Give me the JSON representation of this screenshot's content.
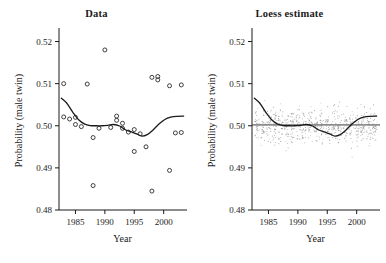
{
  "figure": {
    "width": 386,
    "height": 263,
    "background": "#ffffff",
    "ink_color": "#1a1a1a",
    "cloud_color": "#8a8a8a"
  },
  "chart_data": [
    {
      "type": "scatter",
      "panel": "left",
      "title": "Data",
      "xlabel": "Year",
      "ylabel": "Probability (male twin)",
      "xlim": [
        1982.2,
        2003.8
      ],
      "ylim": [
        0.48,
        0.5225
      ],
      "xticks": [
        1985,
        1990,
        1995,
        2000
      ],
      "xticklabels": [
        "1985",
        "1990",
        "1995",
        "2000"
      ],
      "yticks": [
        0.48,
        0.49,
        0.5,
        0.51,
        0.52
      ],
      "yticklabels": [
        "0.48",
        "0.49",
        "0.50",
        "0.51",
        "0.52"
      ],
      "grid": false,
      "legend": null,
      "marker": "open-circle",
      "x": [
        1983,
        1983,
        1984,
        1985,
        1985,
        1986,
        1987,
        1988,
        1988,
        1989,
        1990,
        1991,
        1992,
        1992,
        1993,
        1993,
        1994,
        1995,
        1995,
        1996,
        1997,
        1998,
        1998,
        1999,
        1999,
        2001,
        2001,
        2002,
        2003,
        2003
      ],
      "y": [
        0.51,
        0.5021,
        0.5016,
        0.5003,
        0.502,
        0.4998,
        0.5099,
        0.4858,
        0.4972,
        0.4994,
        0.518,
        0.4996,
        0.5023,
        0.5013,
        0.5006,
        0.4994,
        0.4985,
        0.4939,
        0.4991,
        0.4981,
        0.495,
        0.4845,
        0.5115,
        0.5117,
        0.5109,
        0.4894,
        0.5095,
        0.4983,
        0.5097,
        0.4984
      ],
      "series": [
        {
          "name": "loess",
          "type": "line",
          "x": [
            1982.6,
            1983.5,
            1984.5,
            1985.5,
            1986.5,
            1987.5,
            1988.5,
            1989.5,
            1990.5,
            1991.5,
            1992.5,
            1993.5,
            1994.5,
            1995.5,
            1996.3,
            1997.2,
            1998.2,
            1999.2,
            2000.2,
            2001.2,
            2002.2,
            2003.4
          ],
          "y": [
            0.50655,
            0.5054,
            0.5033,
            0.5015,
            0.50045,
            0.50005,
            0.5,
            0.5,
            0.5001,
            0.5003,
            0.49995,
            0.49905,
            0.49855,
            0.498,
            0.49755,
            0.4979,
            0.499,
            0.5004,
            0.5015,
            0.50205,
            0.50225,
            0.5023
          ]
        }
      ]
    },
    {
      "type": "scatter",
      "panel": "right",
      "title": "Loess estimate",
      "xlabel": "Year",
      "ylabel": "Probability (male twin)",
      "xlim": [
        1982.2,
        2003.8
      ],
      "ylim": [
        0.48,
        0.5225
      ],
      "xticks": [
        1985,
        1990,
        1995,
        2000
      ],
      "xticklabels": [
        "1985",
        "1990",
        "1995",
        "2000"
      ],
      "yticks": [
        0.48,
        0.49,
        0.5,
        0.51,
        0.52
      ],
      "yticklabels": [
        "0.48",
        "0.49",
        "0.50",
        "0.51",
        "0.52"
      ],
      "grid": false,
      "legend": null,
      "marker": "small-dot",
      "reference_line": {
        "orientation": "horizontal",
        "y": 0.5002,
        "color": "#3a3a3a"
      },
      "cloud": {
        "description": "per-year vertical columns of jittered observations",
        "years": [
          1983,
          1984,
          1985,
          1986,
          1987,
          1988,
          1989,
          1990,
          1991,
          1992,
          1993,
          1994,
          1995,
          1996,
          1997,
          1998,
          1999,
          2000,
          2001,
          2002,
          2003
        ],
        "points_per_year": 34,
        "y_center": 0.5,
        "y_spread": 0.0062,
        "y_min": 0.4855,
        "y_max": 0.5135
      },
      "series": [
        {
          "name": "loess",
          "type": "line",
          "x": [
            1982.6,
            1983.5,
            1984.5,
            1985.5,
            1986.5,
            1987.5,
            1988.5,
            1989.5,
            1990.5,
            1991.5,
            1992.5,
            1993.5,
            1994.5,
            1995.5,
            1996.3,
            1997.2,
            1998.2,
            1999.2,
            2000.2,
            2001.2,
            2002.2,
            2003.4
          ],
          "y": [
            0.50655,
            0.5054,
            0.5033,
            0.5015,
            0.50045,
            0.50005,
            0.5,
            0.5,
            0.5001,
            0.5003,
            0.49995,
            0.49905,
            0.49855,
            0.498,
            0.49755,
            0.4979,
            0.499,
            0.5004,
            0.5015,
            0.50205,
            0.50225,
            0.5023
          ]
        }
      ]
    }
  ]
}
